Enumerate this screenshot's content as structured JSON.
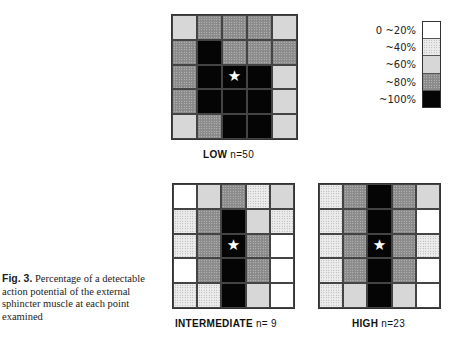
{
  "figure": {
    "caption_label": "Fig. 3.",
    "caption_text": " Percentage of a detectable action potential of the external sphincter muscle at each point examined"
  },
  "legend": {
    "items": [
      {
        "label": "0 ~20%",
        "level": 20,
        "color": "#ffffff",
        "pattern": "blank"
      },
      {
        "label": "~40%",
        "level": 40,
        "color": "#ececec",
        "pattern": "fine-dots"
      },
      {
        "label": "~60%",
        "level": 60,
        "color": "#d7d7d7",
        "pattern": "light-gray"
      },
      {
        "label": "~80%",
        "level": 80,
        "color": "#8a8a8a",
        "pattern": "crosshatch"
      },
      {
        "label": "~100%",
        "level": 100,
        "color": "#050505",
        "pattern": "solid-black"
      }
    ]
  },
  "panels": [
    {
      "name": "LOW",
      "n_label": "n=50",
      "marker": "★"
    },
    {
      "name": "INTERMEDIATE",
      "n_label": "n= 9",
      "marker": "★"
    },
    {
      "name": "HIGH",
      "n_label": "n=23",
      "marker": "★"
    }
  ],
  "chart_data": {
    "type": "heatmap",
    "title": "Percentage of a detectable action potential of the external sphincter muscle at each point examined",
    "xlabel": "",
    "ylabel": "",
    "legend_position": "top-right",
    "scale_bins": [
      "0~20%",
      "~40%",
      "~60%",
      "~80%",
      "~100%"
    ],
    "marker": {
      "symbol": "star",
      "row": 3,
      "col": 3
    },
    "grids": [
      {
        "name": "LOW",
        "n": 50,
        "values": [
          [
            60,
            80,
            80,
            80,
            60
          ],
          [
            80,
            100,
            80,
            80,
            80
          ],
          [
            80,
            100,
            100,
            100,
            60
          ],
          [
            80,
            100,
            100,
            100,
            60
          ],
          [
            60,
            80,
            100,
            100,
            60
          ]
        ]
      },
      {
        "name": "INTERMEDIATE",
        "n": 9,
        "values": [
          [
            20,
            60,
            80,
            40,
            60
          ],
          [
            40,
            80,
            100,
            60,
            40
          ],
          [
            40,
            80,
            100,
            80,
            20
          ],
          [
            20,
            80,
            100,
            80,
            20
          ],
          [
            40,
            40,
            100,
            60,
            20
          ]
        ]
      },
      {
        "name": "HIGH",
        "n": 23,
        "values": [
          [
            40,
            80,
            100,
            80,
            60
          ],
          [
            40,
            80,
            100,
            80,
            20
          ],
          [
            40,
            80,
            100,
            80,
            40
          ],
          [
            40,
            80,
            100,
            80,
            20
          ],
          [
            40,
            60,
            100,
            60,
            20
          ]
        ]
      }
    ]
  }
}
